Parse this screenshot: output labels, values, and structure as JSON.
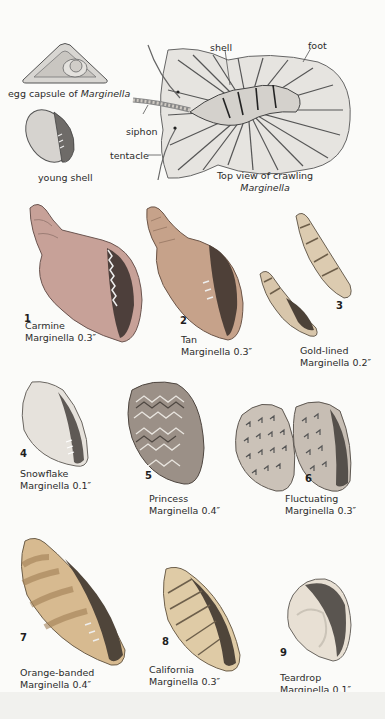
{
  "diagram": {
    "egg_capsule_label_prefix": "egg capsule of ",
    "egg_capsule_label_genus": "Marginella",
    "young_shell_label": "young shell",
    "callouts": {
      "shell": "shell",
      "foot": "foot",
      "siphon": "siphon",
      "tentacle": "tentacle"
    },
    "top_view_caption_line1": "Top view of crawling",
    "top_view_caption_line2": "Marginella"
  },
  "species": [
    {
      "number": "1",
      "name": "Carmine",
      "genus_size": "Marginella 0.3″",
      "color": "#c9a39a"
    },
    {
      "number": "2",
      "name": "Tan",
      "genus_size": "Marginella 0.3″",
      "color": "#c8a48a"
    },
    {
      "number": "3",
      "name": "Gold-lined",
      "genus_size": "Marginella 0.2″",
      "color": "#d9c8ae"
    },
    {
      "number": "4",
      "name": "Snowflake",
      "genus_size": "Marginella 0.1″",
      "color": "#e6e2dc"
    },
    {
      "number": "5",
      "name": "Princess",
      "genus_size": "Marginella 0.4″",
      "color": "#9a8f86"
    },
    {
      "number": "6",
      "name": "Fluctuating",
      "genus_size": "Marginella 0.3″",
      "color": "#c9c0b6"
    },
    {
      "number": "7",
      "name": "Orange-banded",
      "genus_size": "Marginella 0.4″",
      "color": "#d7b98d"
    },
    {
      "number": "8",
      "name": "California",
      "genus_size": "Marginella 0.3″",
      "color": "#ddc9a4"
    },
    {
      "number": "9",
      "name": "Teardrop",
      "genus_size": "Marginella 0.1″",
      "color": "#e8e0d4"
    }
  ]
}
